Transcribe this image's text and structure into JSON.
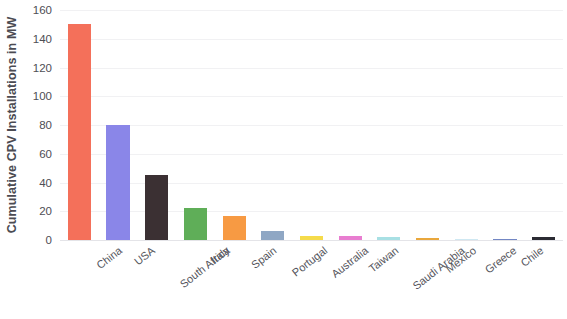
{
  "chart_data": {
    "type": "bar",
    "title": "",
    "xlabel": "",
    "ylabel": "Cumulative CPV Installations in MW",
    "ylim": [
      0,
      160
    ],
    "yticks": [
      0,
      20,
      40,
      60,
      80,
      100,
      120,
      140,
      160
    ],
    "grid": true,
    "legend": "none",
    "categories": [
      "China",
      "USA",
      "South Africa",
      "Italy",
      "Spain",
      "Portugal",
      "Australia",
      "Taiwan",
      "Saudi Arabia",
      "Mexico",
      "Greece",
      "Chile",
      "Rest of the world"
    ],
    "values": [
      150,
      80,
      45,
      22,
      17,
      6,
      3,
      2.5,
      2,
      1.5,
      1,
      1,
      2
    ],
    "colors": [
      "#F4705A",
      "#8A86E8",
      "#3B3033",
      "#5FAE58",
      "#F79A43",
      "#8FA7C4",
      "#F5DB4B",
      "#E87DD0",
      "#A8E0E4",
      "#E9A73C",
      "#CFE8F2",
      "#7387C4",
      "#2B2B33"
    ]
  }
}
